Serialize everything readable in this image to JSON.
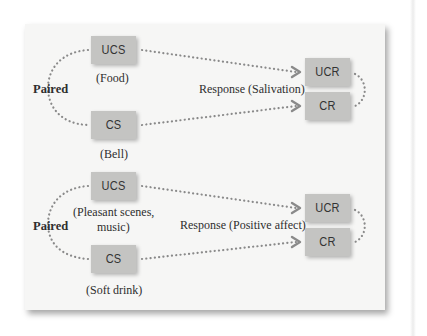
{
  "colors": {
    "panel_bg": "#f6f6f5",
    "box_fill": "#c4c4c2",
    "dots": "#8a8a8a",
    "text": "#2e2e2e"
  },
  "diagrams": [
    {
      "paired_label": "Paired",
      "ucs": {
        "label": "UCS",
        "caption": "(Food)"
      },
      "cs": {
        "label": "CS",
        "caption": "(Bell)"
      },
      "response_label": "Response (Salivation)",
      "ucr": {
        "label": "UCR"
      },
      "cr": {
        "label": "CR"
      }
    },
    {
      "paired_label": "Paired",
      "ucs": {
        "label": "UCS",
        "caption_line1": "(Pleasant scenes,",
        "caption_line2": "music)"
      },
      "cs": {
        "label": "CS",
        "caption": "(Soft drink)"
      },
      "response_label": "Response (Positive affect)",
      "ucr": {
        "label": "UCR"
      },
      "cr": {
        "label": "CR"
      }
    }
  ]
}
